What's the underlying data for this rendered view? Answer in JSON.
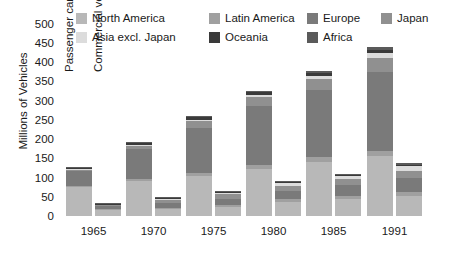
{
  "chart_data": {
    "type": "bar",
    "title": "",
    "xlabel": "",
    "ylabel": "Millions of Vehicles",
    "ylim": [
      0,
      500
    ],
    "ytick_step": 50,
    "yticks": [
      500,
      450,
      400,
      350,
      300,
      250,
      200,
      150,
      100,
      50,
      0
    ],
    "grid": false,
    "legend_position": "top",
    "categories": [
      "1965",
      "1970",
      "1975",
      "1980",
      "1985",
      "1991"
    ],
    "group_labels": [
      "Passenger cars",
      "Commercial vehicles"
    ],
    "stack_order": [
      "North America",
      "Latin America",
      "Europe",
      "Japan",
      "Asia excl. Japan",
      "Oceania",
      "Africa"
    ],
    "series": [
      {
        "name": "North America",
        "color": "#b8b8b8",
        "passenger_cars": [
          75,
          90,
          103,
          122,
          140,
          155
        ],
        "commercial_vehicles": [
          15,
          19,
          24,
          36,
          43,
          52
        ]
      },
      {
        "name": "Latin America",
        "color": "#a0a0a0",
        "passenger_cars": [
          3,
          5,
          8,
          11,
          13,
          15
        ],
        "commercial_vehicles": [
          2,
          3,
          5,
          7,
          9,
          11
        ]
      },
      {
        "name": "Europe",
        "color": "#7a7a7a",
        "passenger_cars": [
          40,
          78,
          118,
          152,
          175,
          205
        ],
        "commercial_vehicles": [
          8,
          12,
          16,
          22,
          28,
          35
        ]
      },
      {
        "name": "Japan",
        "color": "#909090",
        "passenger_cars": [
          2,
          9,
          17,
          23,
          27,
          36
        ],
        "commercial_vehicles": [
          4,
          8,
          11,
          14,
          16,
          20
        ]
      },
      {
        "name": "Asia excl. Japan",
        "color": "#dcdcdc",
        "passenger_cars": [
          2,
          3,
          4,
          6,
          8,
          12
        ],
        "commercial_vehicles": [
          2,
          3,
          4,
          6,
          8,
          11
        ]
      },
      {
        "name": "Oceania",
        "color": "#3a3a3a",
        "passenger_cars": [
          4,
          5,
          6,
          7,
          8,
          9
        ],
        "commercial_vehicles": [
          1,
          2,
          2,
          3,
          3,
          4
        ]
      },
      {
        "name": "Africa",
        "color": "#5a5a5a",
        "passenger_cars": [
          2,
          3,
          4,
          5,
          6,
          7
        ],
        "commercial_vehicles": [
          1,
          2,
          2,
          3,
          3,
          4
        ]
      }
    ],
    "passenger_totals": [
      128,
      193,
      260,
      326,
      377,
      439
    ],
    "commercial_totals": [
      33,
      49,
      64,
      91,
      110,
      137
    ]
  },
  "legend": {
    "row1": [
      {
        "label": "North America",
        "color": "#b8b8b8",
        "swatch": "legend-swatch-north-america"
      },
      {
        "label": "Latin America",
        "color": "#a0a0a0",
        "swatch": "legend-swatch-latin-america"
      },
      {
        "label": "Europe",
        "color": "#7a7a7a",
        "swatch": "legend-swatch-europe"
      },
      {
        "label": "Japan",
        "color": "#909090",
        "swatch": "legend-swatch-japan"
      }
    ],
    "row2": [
      {
        "label": "Asia excl. Japan",
        "color": "#dcdcdc",
        "swatch": "legend-swatch-asia-excl-japan"
      },
      {
        "label": "Oceania",
        "color": "#3a3a3a",
        "swatch": "legend-swatch-oceania"
      },
      {
        "label": "Africa",
        "color": "#5a5a5a",
        "swatch": "legend-swatch-africa"
      }
    ]
  },
  "annotations": {
    "passenger_cars": "Passenger cars",
    "commercial_vehicles": "Commercial vehicles"
  }
}
